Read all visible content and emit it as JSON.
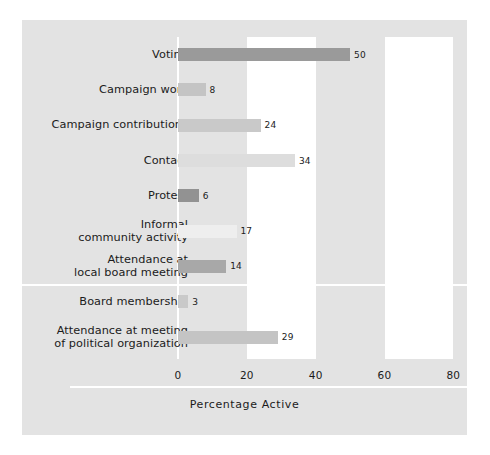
{
  "chart_data": {
    "type": "bar",
    "orientation": "horizontal",
    "title": "",
    "xlabel": "Percentage Active",
    "ylabel": "",
    "xlim": [
      0,
      86
    ],
    "xticks": [
      0,
      20,
      40,
      60,
      80
    ],
    "xticklabels": [
      "0",
      "20",
      "40",
      "60",
      "80"
    ],
    "grid": false,
    "legend": "none",
    "background": "#e3e3e3",
    "band_color": "#ffffff",
    "bands": [
      [
        20,
        40
      ],
      [
        60,
        80
      ]
    ],
    "group_separator_after_category": 7,
    "categories": [
      "Voting",
      "Campaign work",
      "Campaign contributions",
      "Contact",
      "Protest",
      "Informal\ncommunity activity",
      "Attendance at\nlocal board meeting",
      "Board membership",
      "Attendance at meeting\nof political organization"
    ],
    "values": [
      50,
      8,
      24,
      34,
      6,
      17,
      14,
      3,
      29
    ],
    "value_labels": [
      "50",
      "8",
      "24",
      "34",
      "6",
      "17",
      "14",
      "3",
      "29"
    ],
    "bar_colors": [
      "#9a9a9a",
      "#c4c4c4",
      "#c9c9c9",
      "#dddddd",
      "#929292",
      "#eeeeee",
      "#a8a8a8",
      "#c9c9c9",
      "#c4c4c4"
    ]
  }
}
